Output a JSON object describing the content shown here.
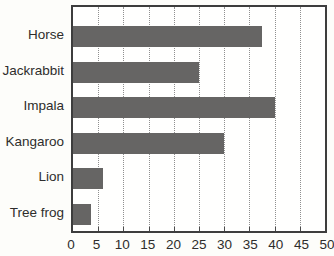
{
  "chart_data": {
    "type": "bar",
    "orientation": "horizontal",
    "title": "",
    "xlabel": "",
    "ylabel": "",
    "categories": [
      "Horse",
      "Jackrabbit",
      "Impala",
      "Kangaroo",
      "Lion",
      "Tree frog"
    ],
    "values": [
      37.5,
      25,
      40,
      30,
      6,
      3.5
    ],
    "xlim": [
      0,
      50
    ],
    "xticks": [
      0,
      5,
      10,
      15,
      20,
      25,
      30,
      35,
      40,
      45,
      50
    ],
    "grid": "vertical-dotted",
    "legend": "none",
    "colors": {
      "bar": "#666564",
      "plot_border": "#3d3d3d",
      "gridline": "#8f8f8f",
      "text": "#2e2d2c",
      "background": "#fdfdfa"
    }
  }
}
